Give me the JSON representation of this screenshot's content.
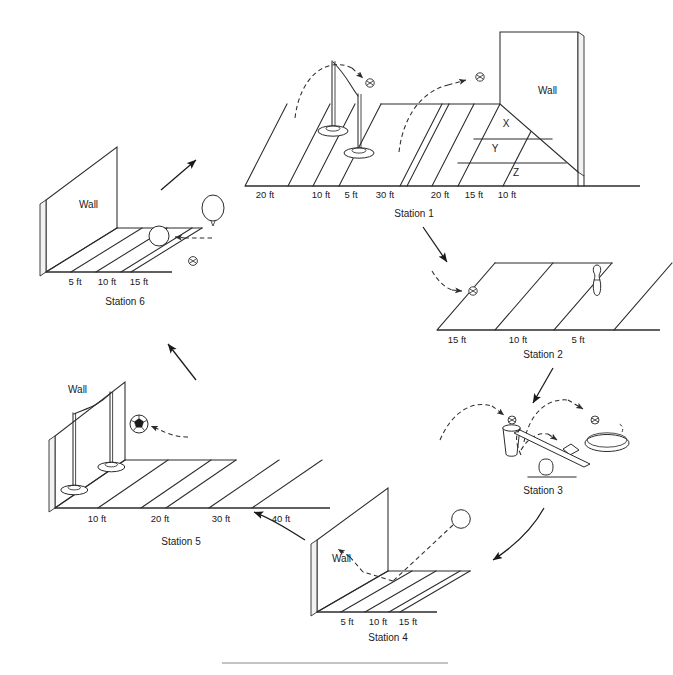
{
  "figure": {
    "footer_rule": true
  },
  "labels": {
    "wall": "Wall",
    "unit": "ft"
  },
  "stations": [
    {
      "id": "station-1",
      "name": "Station 1",
      "wall_label": "Wall",
      "distance_labels": [
        "20 ft",
        "10 ft",
        "5 ft",
        "30 ft",
        "20 ft",
        "15 ft",
        "10 ft"
      ],
      "zone_labels": [
        "X",
        "Y",
        "Z"
      ],
      "objects": [
        "pole-tall",
        "pole-short",
        "ball",
        "ball",
        "wall",
        "floor-grid"
      ],
      "trajectories": [
        "dashed-arc-to-ball-left",
        "dashed-arc-to-ball-right"
      ]
    },
    {
      "id": "station-2",
      "name": "Station 2",
      "distance_labels": [
        "15 ft",
        "10 ft",
        "5 ft"
      ],
      "objects": [
        "bowling-pin",
        "ball",
        "floor-grid"
      ],
      "trajectories": [
        "dashed-arc-to-ball"
      ]
    },
    {
      "id": "station-3",
      "name": "Station 3",
      "distance_labels": [],
      "objects": [
        "cup",
        "beanbag",
        "hoop",
        "seesaw",
        "ball",
        "ball"
      ],
      "trajectories": [
        "dashed-arc-left",
        "dashed-arc-right",
        "dashed-arc-beanbag",
        "dashed-arc-from-seesaw"
      ]
    },
    {
      "id": "station-4",
      "name": "Station 4",
      "wall_label": "Wall",
      "distance_labels": [
        "5 ft",
        "10 ft",
        "15 ft"
      ],
      "objects": [
        "ball",
        "wall",
        "floor-grid"
      ],
      "trajectories": [
        "dashed-bounce-off-wall"
      ]
    },
    {
      "id": "station-5",
      "name": "Station 5",
      "wall_label": "Wall",
      "distance_labels": [
        "10 ft",
        "20 ft",
        "30 ft",
        "40 ft"
      ],
      "objects": [
        "pole-tall",
        "pole-short",
        "soccer-ball",
        "wall",
        "floor-grid"
      ],
      "trajectories": [
        "dashed-arrow-to-soccer-ball"
      ]
    },
    {
      "id": "station-6",
      "name": "Station 6",
      "wall_label": "Wall",
      "distance_labels": [
        "5 ft",
        "10 ft",
        "15 ft"
      ],
      "objects": [
        "balloon",
        "ball",
        "small-ball",
        "wall",
        "floor-grid"
      ],
      "trajectories": [
        "dashed-arrow-to-ball"
      ]
    }
  ],
  "flow": {
    "sequence": [
      "Station 1",
      "Station 2",
      "Station 3",
      "Station 4",
      "Station 5",
      "Station 6"
    ],
    "arrows": [
      {
        "from": "Station 1",
        "to": "Station 2",
        "direction": "down-right"
      },
      {
        "from": "Station 2",
        "to": "Station 3",
        "direction": "down-left"
      },
      {
        "from": "Station 3",
        "to": "Station 4",
        "direction": "down-left"
      },
      {
        "from": "Station 4",
        "to": "Station 5",
        "direction": "up-left"
      },
      {
        "from": "Station 5",
        "to": "Station 6",
        "direction": "up-left"
      },
      {
        "from": "Station 6",
        "to": "Station 1",
        "direction": "up-right"
      }
    ]
  },
  "colors": {
    "ink": "#2b2b2b",
    "paper": "#ffffff",
    "wall_shade": "#f2f2f2",
    "rule": "#7a7a7a"
  }
}
